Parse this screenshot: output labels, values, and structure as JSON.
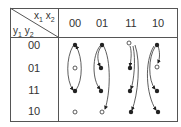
{
  "diagram": {
    "type": "state-transition-table",
    "corner": {
      "column_var": "x1 x2",
      "column_var_parts": [
        "x",
        "1",
        "x",
        "2"
      ],
      "row_var": "y1 y2",
      "row_var_parts": [
        "y",
        "1",
        "y",
        "2"
      ]
    },
    "columns": [
      "00",
      "01",
      "11",
      "10"
    ],
    "rows": [
      "00",
      "01",
      "11",
      "10"
    ],
    "cells": [
      {
        "row": "00",
        "col": "00",
        "state": "stable"
      },
      {
        "row": "01",
        "col": "00",
        "state": "unstable"
      },
      {
        "row": "11",
        "col": "00",
        "state": "stable"
      },
      {
        "row": "10",
        "col": "00",
        "state": "unstable"
      },
      {
        "row": "00",
        "col": "01",
        "state": "stable"
      },
      {
        "row": "01",
        "col": "01",
        "state": "stable"
      },
      {
        "row": "11",
        "col": "01",
        "state": "stable"
      },
      {
        "row": "10",
        "col": "01",
        "state": "unstable"
      },
      {
        "row": "00",
        "col": "11",
        "state": "unstable"
      },
      {
        "row": "01",
        "col": "11",
        "state": "stable"
      },
      {
        "row": "11",
        "col": "11",
        "state": "stable"
      },
      {
        "row": "10",
        "col": "11",
        "state": "stable"
      },
      {
        "row": "00",
        "col": "10",
        "state": "stable"
      },
      {
        "row": "01",
        "col": "10",
        "state": "unstable"
      },
      {
        "row": "11",
        "col": "10",
        "state": "stable"
      },
      {
        "row": "10",
        "col": "10",
        "state": "stable"
      }
    ],
    "legend": {
      "stable": "filled dot",
      "unstable": "open circle"
    },
    "colors": {
      "line": "#555555",
      "ink": "#222222",
      "background": "#ffffff"
    }
  }
}
